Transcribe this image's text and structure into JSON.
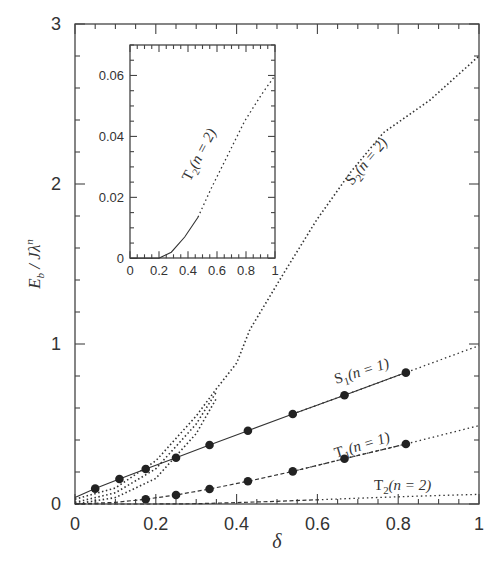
{
  "chart_data": [
    {
      "type": "line",
      "panel": "main",
      "title": "",
      "xlabel": "δ",
      "ylabel": "E_b / Jλ^n",
      "xlim": [
        0,
        1
      ],
      "ylim": [
        0,
        3
      ],
      "x_ticks": [
        0,
        0.2,
        0.4,
        0.6,
        0.8,
        1
      ],
      "x_tick_labels": [
        "0",
        "0.2",
        "0.4",
        "0.6",
        "0.8",
        "1"
      ],
      "y_ticks": [
        0,
        1,
        2,
        3
      ],
      "y_tick_labels": [
        "0",
        "1",
        "2",
        "3"
      ],
      "grid": false,
      "series": [
        {
          "name": "S2 (n = 2)",
          "label_main": "S",
          "label_sub": "2",
          "label_rest": "(n = 2)",
          "style": "dotted",
          "x": [
            0,
            0.1,
            0.2,
            0.3,
            0.35,
            0.4,
            0.433,
            0.516,
            0.598,
            0.681,
            0.763,
            0.879,
            1.0
          ],
          "y": [
            0.03,
            0.1,
            0.27,
            0.55,
            0.72,
            0.88,
            1.09,
            1.44,
            1.775,
            2.07,
            2.32,
            2.525,
            2.8
          ]
        },
        {
          "name": "S2 (n = 2) variant a",
          "style": "dotted",
          "x": [
            0,
            0.1,
            0.2,
            0.3,
            0.35
          ],
          "y": [
            0.01,
            0.07,
            0.22,
            0.5,
            0.7
          ]
        },
        {
          "name": "S2 (n = 2) variant b",
          "style": "dotted",
          "x": [
            0,
            0.1,
            0.2,
            0.3,
            0.35
          ],
          "y": [
            0.0,
            0.04,
            0.16,
            0.44,
            0.66
          ]
        },
        {
          "name": "S1 (n = 1)",
          "label_main": "S",
          "label_sub": "1",
          "label_rest": "(n = 1)",
          "style": "solid-to-dotted",
          "x": [
            0,
            0.05,
            0.11,
            0.175,
            0.25,
            0.333,
            0.428,
            0.539,
            0.667,
            0.819,
            1.0
          ],
          "y": [
            0.04,
            0.096,
            0.156,
            0.219,
            0.289,
            0.369,
            0.458,
            0.5625,
            0.68,
            0.821,
            0.99
          ],
          "markers_x": [
            0.05,
            0.11,
            0.175,
            0.25,
            0.333,
            0.428,
            0.539,
            0.667,
            0.819
          ],
          "markers_y": [
            0.096,
            0.156,
            0.219,
            0.289,
            0.369,
            0.458,
            0.5625,
            0.68,
            0.821
          ]
        },
        {
          "name": "T1 (n = 1)",
          "label_main": "T",
          "label_sub": "1",
          "label_rest": "(n = 1)",
          "style": "dashed-to-dotted",
          "x": [
            0,
            0.1,
            0.175,
            0.25,
            0.333,
            0.428,
            0.539,
            0.667,
            0.819,
            1.0
          ],
          "y": [
            0.0,
            0.01,
            0.03,
            0.056,
            0.094,
            0.142,
            0.204,
            0.283,
            0.375,
            0.49
          ],
          "markers_x": [
            0.175,
            0.25,
            0.333,
            0.428,
            0.539,
            0.667,
            0.819
          ],
          "markers_y": [
            0.03,
            0.056,
            0.094,
            0.142,
            0.204,
            0.283,
            0.375
          ]
        },
        {
          "name": "T2 (n = 2)",
          "label_main": "T",
          "label_sub": "2",
          "label_rest": "(n = 2)",
          "style": "dashed-to-dotted",
          "x": [
            0,
            0.2,
            0.3,
            0.4,
            0.5,
            0.6,
            0.7,
            0.8,
            0.9,
            1.0
          ],
          "y": [
            0.0,
            0.0,
            0.002,
            0.009,
            0.017,
            0.026,
            0.036,
            0.045,
            0.053,
            0.06
          ]
        }
      ]
    },
    {
      "type": "line",
      "panel": "inset",
      "title": "",
      "xlim": [
        0,
        1
      ],
      "ylim": [
        0,
        0.07
      ],
      "x_ticks": [
        0,
        0.2,
        0.4,
        0.6,
        0.8,
        1
      ],
      "x_tick_labels": [
        "0",
        "0.2",
        "0.4",
        "0.6",
        "0.8",
        "1"
      ],
      "y_ticks": [
        0,
        0.02,
        0.04,
        0.06
      ],
      "y_tick_labels": [
        "0",
        "0.02",
        "0.04",
        "0.06"
      ],
      "grid": false,
      "series": [
        {
          "name": "T2 (n = 2)",
          "label_main": "T",
          "label_sub": "2",
          "label_rest": "(n = 2)",
          "style": "solid-to-dotted",
          "x": [
            0,
            0.2,
            0.22,
            0.285,
            0.377,
            0.469,
            0.561,
            0.676,
            0.79,
            0.906,
            1.0
          ],
          "y": [
            0,
            0,
            0.0005,
            0.002,
            0.007,
            0.0135,
            0.023,
            0.034,
            0.045,
            0.0537,
            0.06
          ]
        }
      ]
    }
  ],
  "labels": {
    "xlabel": "δ",
    "ylabel_main": "E",
    "ylabel_sub": "b",
    "ylabel_rest": " / Jλ",
    "ylabel_sup": "n"
  }
}
